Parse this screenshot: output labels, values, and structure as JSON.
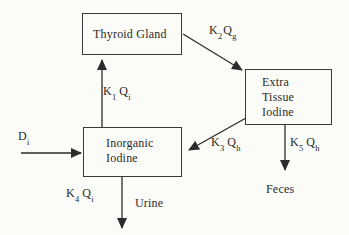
{
  "colors": {
    "background": "#fbfbf8",
    "line": "#2b2b2b",
    "text": "#2b2b2b"
  },
  "diagram": {
    "boxes": {
      "thyroid_gland": {
        "label": "Thyroid Gland"
      },
      "extra_tissue_iodine": {
        "label": "Extra Tissue Iodine"
      },
      "inorganic_iodine": {
        "label": "Inorganic Iodine"
      }
    },
    "flows": {
      "k1": {
        "coef": "K",
        "coef_sub": "1",
        "var": "Q",
        "var_sub": "i",
        "from": "Inorganic Iodine",
        "to": "Thyroid Gland"
      },
      "k2": {
        "coef": "K",
        "coef_sub": "2",
        "var": "Q",
        "var_sub": "g",
        "from": "Thyroid Gland",
        "to": "Extra Tissue Iodine"
      },
      "k3": {
        "coef": "K",
        "coef_sub": "3",
        "var": "Q",
        "var_sub": "h",
        "from": "Extra Tissue Iodine",
        "to": "Inorganic Iodine"
      },
      "k4": {
        "coef": "K",
        "coef_sub": "4",
        "var": "Q",
        "var_sub": "i",
        "from": "Inorganic Iodine",
        "to": "Urine"
      },
      "k5": {
        "coef": "K",
        "coef_sub": "5",
        "var": "Q",
        "var_sub": "h",
        "from": "Extra Tissue Iodine",
        "to": "Feces"
      }
    },
    "input": {
      "coef": "D",
      "coef_sub": "i",
      "to": "Inorganic Iodine"
    },
    "sinks": {
      "urine": "Urine",
      "feces": "Feces"
    }
  }
}
